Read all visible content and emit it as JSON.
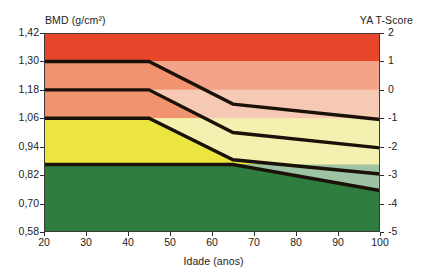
{
  "axes": {
    "left_title": "BMD (g/cm²)",
    "right_title": "YA T-Score",
    "x_title": "Idade (anos)",
    "left_ticks": [
      "1,42",
      "1,30",
      "1,18",
      "1,06",
      "0,94",
      "0,82",
      "0,70",
      "0,58"
    ],
    "right_ticks": [
      "2",
      "1",
      "0",
      "-1",
      "-2",
      "-3",
      "-4",
      "-5"
    ],
    "x_ticks": [
      "20",
      "30",
      "40",
      "50",
      "60",
      "70",
      "80",
      "90",
      "100"
    ]
  },
  "colors": {
    "red": "#E8462A",
    "salmon": "#F0936E",
    "yellow": "#EDE53F",
    "green": "#2E7D3E",
    "red_light": "#F2A388",
    "salmon_light": "#F6C9B4",
    "yellow_light": "#F4F0B0",
    "green_light": "#9DC3A4",
    "line": "#1A1209",
    "axis": "#2b2b2b",
    "text": "#1d1d1d"
  },
  "chart_data": {
    "type": "area",
    "title": "",
    "xlabel": "Idade (anos)",
    "ylabel": "BMD (g/cm²)",
    "y2label": "YA T-Score",
    "xlim": [
      20,
      100
    ],
    "ylim": [
      0.58,
      1.42
    ],
    "y2lim": [
      -5,
      2
    ],
    "grid": false,
    "legend": "none",
    "band_boundaries_bmd": [
      1.3,
      1.18,
      1.06,
      0.865
    ],
    "bands": [
      {
        "name": "red",
        "from_bmd": 1.3,
        "to_bmd": 1.42,
        "color": "#E8462A"
      },
      {
        "name": "salmon-upper",
        "from_bmd": 1.18,
        "to_bmd": 1.3,
        "color": "#F0936E"
      },
      {
        "name": "salmon-lower",
        "from_bmd": 1.06,
        "to_bmd": 1.18,
        "color": "#F0936E"
      },
      {
        "name": "yellow",
        "from_bmd": 0.865,
        "to_bmd": 1.06,
        "color": "#EDE53F"
      },
      {
        "name": "green",
        "from_bmd": 0.58,
        "to_bmd": 0.865,
        "color": "#2E7D3E"
      }
    ],
    "series": [
      {
        "name": "curve-1-upper",
        "x": [
          20,
          45,
          65,
          100
        ],
        "y": [
          1.3,
          1.3,
          1.12,
          1.055
        ]
      },
      {
        "name": "curve-2-middle",
        "x": [
          20,
          45,
          65,
          100
        ],
        "y": [
          1.18,
          1.18,
          1.0,
          0.935
        ]
      },
      {
        "name": "curve-3-lower",
        "x": [
          20,
          45,
          65,
          100
        ],
        "y": [
          1.06,
          1.06,
          0.885,
          0.825
        ]
      },
      {
        "name": "curve-4-bottom",
        "x": [
          20,
          65,
          100
        ],
        "y": [
          0.865,
          0.865,
          0.755
        ]
      }
    ]
  }
}
